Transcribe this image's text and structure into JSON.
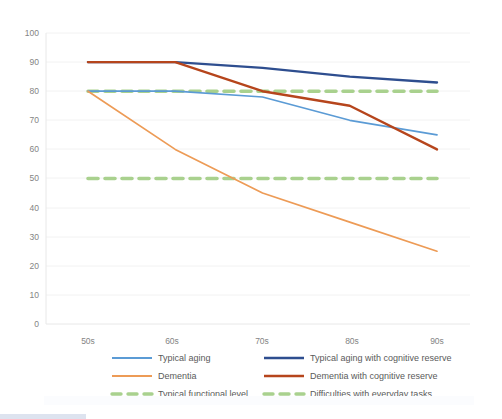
{
  "chart_data": {
    "type": "line",
    "title": "",
    "xlabel": "",
    "ylabel": "",
    "categories": [
      "50s",
      "60s",
      "70s",
      "80s",
      "90s"
    ],
    "ylim": [
      0,
      100
    ],
    "yticks": [
      0,
      10,
      20,
      30,
      40,
      50,
      60,
      70,
      80,
      90,
      100
    ],
    "grid": true,
    "legend_position": "bottom",
    "series": [
      {
        "name": "Typical aging",
        "color": "#5B9BD5",
        "style": "solid",
        "values": [
          80,
          80,
          78,
          70,
          65
        ]
      },
      {
        "name": "Typical aging with cognitive reserve",
        "color": "#2E4E8F",
        "style": "solid",
        "values": [
          90,
          90,
          88,
          85,
          83
        ]
      },
      {
        "name": "Dementia",
        "color": "#ED9B56",
        "style": "solid",
        "values": [
          80,
          60,
          45,
          35,
          25
        ]
      },
      {
        "name": "Dementia with cognitive reserve",
        "color": "#B6451C",
        "style": "solid",
        "values": [
          90,
          90,
          80,
          75,
          60
        ]
      },
      {
        "name": "Typical functional level",
        "color": "#A9D18E",
        "style": "dashed",
        "values": [
          80,
          80,
          80,
          80,
          80
        ]
      },
      {
        "name": "Difficulties with everyday tasks",
        "color": "#A9D18E",
        "style": "dashed",
        "values": [
          50,
          50,
          50,
          50,
          50
        ]
      }
    ]
  },
  "legend": {
    "entries": [
      {
        "label": "Typical aging",
        "column": 0,
        "row": 0
      },
      {
        "label": "Dementia",
        "column": 0,
        "row": 1
      },
      {
        "label": "Typical functional level",
        "column": 0,
        "row": 2
      },
      {
        "label": "Typical aging with cognitive reserve",
        "column": 1,
        "row": 0
      },
      {
        "label": "Dementia with cognitive reserve",
        "column": 1,
        "row": 1
      },
      {
        "label": "Difficulties with everyday tasks",
        "column": 1,
        "row": 2
      }
    ]
  },
  "axes": {
    "y_tick_labels": [
      "100",
      "90",
      "80",
      "70",
      "60",
      "50",
      "40",
      "30",
      "20",
      "10",
      "0"
    ],
    "x_tick_labels": [
      "50s",
      "60s",
      "70s",
      "80s",
      "90s"
    ]
  }
}
